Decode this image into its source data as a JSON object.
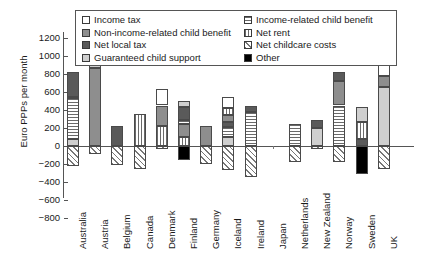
{
  "chart_data": {
    "type": "bar",
    "stacked": true,
    "title": "",
    "xlabel": "",
    "ylabel": "Euro PPPs per month",
    "ylim": [
      -800,
      1200
    ],
    "ytick_step": 200,
    "yticks": [
      "1200",
      "1000",
      "800",
      "600",
      "400",
      "200",
      "0",
      "-200",
      "-400",
      "-600",
      "-800"
    ],
    "grid": false,
    "legend_position": "top-inside",
    "categories": [
      "Australia",
      "Austria",
      "Belgium",
      "Canada",
      "Denmark",
      "Finland",
      "Germany",
      "Iceland",
      "Ireland",
      "Japan",
      "Netherlands",
      "New Zealand",
      "Norway",
      "Sweden",
      "UK"
    ],
    "series": [
      {
        "name": "Income tax",
        "pattern": "white",
        "color": "#ffffff"
      },
      {
        "name": "Non-income-related child benefit",
        "pattern": "midgray",
        "color": "#8e8e8e"
      },
      {
        "name": "Net local tax",
        "pattern": "darkgray",
        "color": "#5a5a5a"
      },
      {
        "name": "Guaranteed child support",
        "pattern": "lightgray",
        "color": "#cfcfcf"
      },
      {
        "name": "Income-related child benefit",
        "pattern": "hstripe",
        "color": "#ffffff"
      },
      {
        "name": "Net rent",
        "pattern": "vstripe",
        "color": "#ffffff"
      },
      {
        "name": "Net childcare costs",
        "pattern": "diag",
        "color": "#ffffff"
      },
      {
        "name": "Other",
        "pattern": "black",
        "color": "#000000"
      }
    ],
    "bars": [
      {
        "category": "Australia",
        "positive_total": 820,
        "negative_total": -225,
        "segments": [
          {
            "series": "Guaranteed child support",
            "value": 75
          },
          {
            "series": "Income-related child benefit",
            "value": 460
          },
          {
            "series": "Non-income-related child benefit",
            "value": 5
          },
          {
            "series": "Net local tax",
            "value": 280
          },
          {
            "series": "Net childcare costs",
            "value": -225
          }
        ]
      },
      {
        "category": "Austria",
        "positive_total": 1065,
        "negative_total": -90,
        "segments": [
          {
            "series": "Non-income-related child benefit",
            "value": 870
          },
          {
            "series": "Guaranteed child support",
            "value": 195
          },
          {
            "series": "Net childcare costs",
            "value": -90
          }
        ]
      },
      {
        "category": "Belgium",
        "positive_total": 225,
        "negative_total": -210,
        "segments": [
          {
            "series": "Net local tax",
            "value": 225
          },
          {
            "series": "Net childcare costs",
            "value": -210
          }
        ]
      },
      {
        "category": "Canada",
        "positive_total": 360,
        "negative_total": -255,
        "segments": [
          {
            "series": "Net rent",
            "value": 360
          },
          {
            "series": "Net childcare costs",
            "value": -255
          }
        ]
      },
      {
        "category": "Denmark",
        "positive_total": 630,
        "negative_total": -30,
        "segments": [
          {
            "series": "Net rent",
            "value": 225
          },
          {
            "series": "Non-income-related child benefit",
            "value": 225
          },
          {
            "series": "Income tax",
            "value": 180
          },
          {
            "series": "Net childcare costs",
            "value": -30
          }
        ]
      },
      {
        "category": "Finland",
        "positive_total": 495,
        "negative_total": -150,
        "segments": [
          {
            "series": "Net rent",
            "value": 105
          },
          {
            "series": "Non-income-related child benefit",
            "value": 135
          },
          {
            "series": "Income-related child benefit",
            "value": 45
          },
          {
            "series": "Net local tax",
            "value": 150
          },
          {
            "series": "Guaranteed child support",
            "value": 60
          },
          {
            "series": "Other",
            "value": -150
          }
        ]
      },
      {
        "category": "Germany",
        "positive_total": 225,
        "negative_total": -195,
        "segments": [
          {
            "series": "Non-income-related child benefit",
            "value": 225
          },
          {
            "series": "Net childcare costs",
            "value": -195
          }
        ]
      },
      {
        "category": "Iceland",
        "positive_total": 540,
        "negative_total": -270,
        "segments": [
          {
            "series": "Guaranteed child support",
            "value": 105
          },
          {
            "series": "Income-related child benefit",
            "value": 105
          },
          {
            "series": "Net local tax",
            "value": 60
          },
          {
            "series": "Non-income-related child benefit",
            "value": 75
          },
          {
            "series": "Net rent",
            "value": 75
          },
          {
            "series": "Income tax",
            "value": 120
          },
          {
            "series": "Net childcare costs",
            "value": -270
          }
        ]
      },
      {
        "category": "Ireland",
        "positive_total": 450,
        "negative_total": -345,
        "segments": [
          {
            "series": "Income-related child benefit",
            "value": 375
          },
          {
            "series": "Net local tax",
            "value": 75
          },
          {
            "series": "Net childcare costs",
            "value": -345
          }
        ]
      },
      {
        "category": "Japan",
        "positive_total": 0,
        "negative_total": 0,
        "segments": []
      },
      {
        "category": "Netherlands",
        "positive_total": 240,
        "negative_total": -180,
        "segments": [
          {
            "series": "Income-related child benefit",
            "value": 240
          },
          {
            "series": "Net childcare costs",
            "value": -180
          }
        ]
      },
      {
        "category": "New Zealand",
        "positive_total": 285,
        "negative_total": -30,
        "segments": [
          {
            "series": "Guaranteed child support",
            "value": 195
          },
          {
            "series": "Net local tax",
            "value": 90
          },
          {
            "series": "Net childcare costs",
            "value": -30
          }
        ]
      },
      {
        "category": "Norway",
        "positive_total": 825,
        "negative_total": -180,
        "segments": [
          {
            "series": "Income-related child benefit",
            "value": 450
          },
          {
            "series": "Non-income-related child benefit",
            "value": 270
          },
          {
            "series": "Net local tax",
            "value": 105
          },
          {
            "series": "Net childcare costs",
            "value": -180
          }
        ]
      },
      {
        "category": "Sweden",
        "positive_total": 435,
        "negative_total": -315,
        "segments": [
          {
            "series": "Net local tax",
            "value": 75
          },
          {
            "series": "Net rent",
            "value": 195
          },
          {
            "series": "Guaranteed child support",
            "value": 165
          },
          {
            "series": "Other",
            "value": -315
          }
        ]
      },
      {
        "category": "UK",
        "positive_total": 930,
        "negative_total": -255,
        "segments": [
          {
            "series": "Guaranteed child support",
            "value": 660
          },
          {
            "series": "Non-income-related child benefit",
            "value": 120
          },
          {
            "series": "Income tax",
            "value": 150
          },
          {
            "series": "Net childcare costs",
            "value": -255
          }
        ]
      }
    ]
  },
  "axis": {
    "ylabel": "Euro PPPs per month",
    "yticks": [
      "1200",
      "1000",
      "800",
      "600",
      "400",
      "200",
      "0",
      "-200",
      "-400",
      "-600",
      "-800"
    ],
    "categories": [
      "Australia",
      "Austria",
      "Belgium",
      "Canada",
      "Denmark",
      "Finland",
      "Germany",
      "Iceland",
      "Ireland",
      "Japan",
      "Netherlands",
      "New Zealand",
      "Norway",
      "Sweden",
      "UK"
    ]
  },
  "legend": {
    "left_column": [
      "Income tax",
      "Non-income-related child benefit",
      "Net local tax",
      "Guaranteed child support"
    ],
    "right_column": [
      "Income-related child benefit",
      "Net rent",
      "Net childcare costs",
      "Other"
    ]
  }
}
